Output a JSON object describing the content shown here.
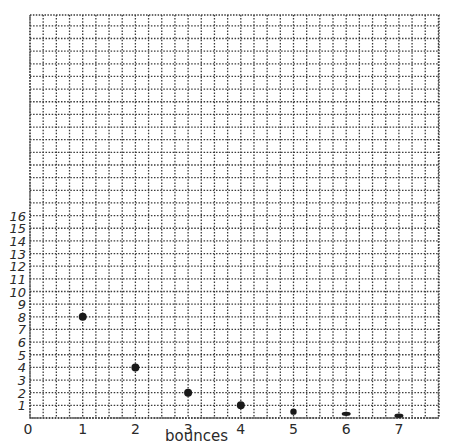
{
  "chart_data": {
    "type": "scatter",
    "title": "",
    "xlabel": "bounces",
    "ylabel": "",
    "x_ticks": [
      "0",
      "1",
      "2",
      "3",
      "4",
      "5",
      "6",
      "7"
    ],
    "y_ticks": [
      "1",
      "2",
      "3",
      "4",
      "5",
      "6",
      "7",
      "8",
      "9",
      "10",
      "11",
      "12",
      "13",
      "14",
      "15",
      "16"
    ],
    "xlim": [
      0,
      7.75
    ],
    "ylim": [
      0,
      31.8
    ],
    "grid": true,
    "grid_style": "dotted",
    "legend": null,
    "series": [
      {
        "name": "height",
        "points": [
          {
            "x": 1,
            "y": 8
          },
          {
            "x": 2,
            "y": 4
          },
          {
            "x": 3,
            "y": 2
          },
          {
            "x": 4,
            "y": 1
          },
          {
            "x": 5,
            "y": 0.5
          },
          {
            "x": 6,
            "y": 0.25
          },
          {
            "x": 7,
            "y": 0.1
          }
        ]
      }
    ]
  },
  "geometry": {
    "origin_x": 30,
    "origin_y": 418,
    "px_per_x_unit": 52.7,
    "px_per_y_unit": 12.65,
    "grid_left": 30,
    "grid_right": 439,
    "grid_top": 15,
    "grid_bottom": 418,
    "cells_per_x_unit": 4
  },
  "colors": {
    "grid": "#3a3a3a",
    "point": "#1a1a1a",
    "text": "#2a2a2a"
  }
}
